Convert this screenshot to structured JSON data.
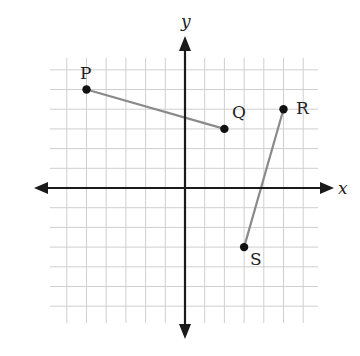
{
  "diagram": {
    "type": "coordinate-plane",
    "origin_px": [
      185,
      188
    ],
    "unit_px": 19.7,
    "grid": {
      "x_range": [
        -6,
        6
      ],
      "y_range": [
        -7,
        6
      ],
      "color": "#cfcfcf"
    },
    "axes": {
      "x_label": "x",
      "y_label": "y",
      "color": "#1a1a1a"
    },
    "points": [
      {
        "name": "P",
        "x": -5,
        "y": 5
      },
      {
        "name": "Q",
        "x": 2,
        "y": 3
      },
      {
        "name": "R",
        "x": 5,
        "y": 4
      },
      {
        "name": "S",
        "x": 3,
        "y": -3
      }
    ],
    "segments": [
      {
        "from": "P",
        "to": "Q",
        "color": "#8a8a8a"
      },
      {
        "from": "R",
        "to": "S",
        "color": "#8a8a8a"
      }
    ]
  },
  "labels": {
    "x_axis": "x",
    "y_axis": "y",
    "P": "P",
    "Q": "Q",
    "R": "R",
    "S": "S"
  }
}
